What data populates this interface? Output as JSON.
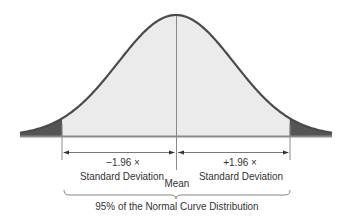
{
  "chart_data": {
    "type": "area",
    "title": "",
    "distribution": "normal",
    "mean_label": "Mean",
    "left_bound": {
      "z": -1.96,
      "label_line1": "−1.96 ×",
      "label_line2": "Standard Deviation"
    },
    "right_bound": {
      "z": 1.96,
      "label_line1": "+1.96 ×",
      "label_line2": "Standard Deviation"
    },
    "central_region": {
      "percent": 95,
      "label": "95% of the Normal Curve Distribution"
    },
    "tails_shaded": true,
    "xlabel": "",
    "ylabel": "",
    "grid": false
  },
  "colors": {
    "curve": "#4a4a4a",
    "fill_center": "#ebebeb",
    "fill_tails": "#555555",
    "lines": "#8a8a8a",
    "text": "#333333"
  },
  "geometry": {
    "mean_x": 176,
    "sigma_px": 58,
    "baseline_y": 136,
    "peak_y": 15,
    "x_min": 20,
    "x_max": 332
  }
}
